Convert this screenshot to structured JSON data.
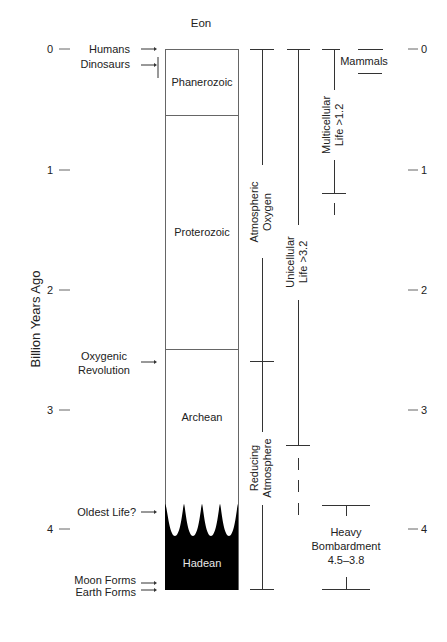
{
  "diagram": {
    "header": {
      "title": "Eon"
    },
    "axis": {
      "title": "Billion Years Ago",
      "ticks": [
        "0",
        "1",
        "2",
        "3",
        "4"
      ]
    },
    "eons": [
      {
        "name": "Phanerozoic",
        "from": 0.0,
        "to": 0.54
      },
      {
        "name": "Proterozoic",
        "from": 0.54,
        "to": 2.5
      },
      {
        "name": "Archean",
        "from": 2.5,
        "to": 3.8
      },
      {
        "name": "Hadean",
        "from": 3.8,
        "to": 4.5
      }
    ],
    "events_left": [
      {
        "label": "Humans",
        "at": 0.0
      },
      {
        "label": "Dinosaurs",
        "at": 0.2
      },
      {
        "label_line1": "Oxygenic",
        "label_line2": "Revolution",
        "at": 2.7
      },
      {
        "label": "Oldest Life?",
        "at": 3.85
      },
      {
        "label": "Moon Forms",
        "at": 4.45
      },
      {
        "label": "Earth Forms",
        "at": 4.5
      }
    ],
    "ranges": {
      "atmospheric_oxygen": {
        "line1": "Atmospheric",
        "line2": "Oxygen"
      },
      "reducing_atmosphere": {
        "line1": "Reducing",
        "line2": "Atmosphere"
      },
      "unicellular_life": {
        "line1": "Unicellular",
        "line2": "Life >3.2"
      },
      "multicellular_life": {
        "line1": "Multicellular",
        "line2": "Life >1.2"
      },
      "mammals": {
        "label": "Mammals"
      },
      "heavy_bombardment": {
        "line1": "Heavy",
        "line2": "Bombardment",
        "line3": "4.5–3.8"
      }
    },
    "colors": {
      "line": "#333333",
      "hadean_fill": "#000000",
      "background": "#ffffff"
    }
  }
}
